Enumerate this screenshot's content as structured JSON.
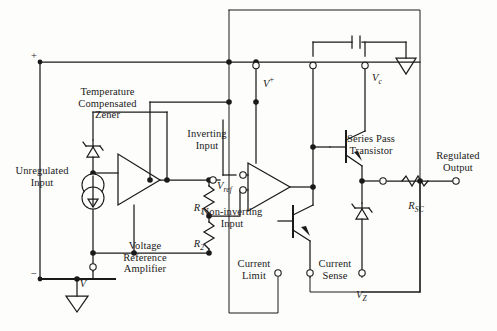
{
  "diagram": {
    "stroke_color": "#1a1a1a",
    "background_color": "#fdfdfb"
  },
  "labels": {
    "unregulated_input": "Unregulated\nInput",
    "temperature_compensated_zener": "Temperature\nCompensated\nZener",
    "voltage_reference_amplifier": "Voltage\nReference\nAmplifier",
    "inverting_input": "Inverting\nInput",
    "non_inverting_input": "Non-inverting\nInput",
    "series_pass_transistor": "Series Pass\nTransistor",
    "regulated_output": "Regulated\nOutput",
    "current_limit": "Current\nLimit",
    "current_sense": "Current\nSense",
    "r1": "R",
    "r1_sub": "1",
    "r2": "R",
    "r2_sub": "2",
    "rsc": "R",
    "rsc_sub": "SC",
    "vref": "V",
    "vref_sub": "ref",
    "vplus": "V",
    "vplus_sup": "+",
    "vminus": "V",
    "vminus_sup": "−",
    "vc": "V",
    "vc_sub": "c",
    "vz": "V",
    "vz_sub": "Z",
    "plus_sign": "+",
    "minus_sign": "−"
  },
  "terminals": [
    {
      "name": "v-plus-terminal",
      "label": "V+"
    },
    {
      "name": "vc-terminal",
      "label": "Vc"
    },
    {
      "name": "v-minus-terminal",
      "label": "V-"
    },
    {
      "name": "vref-terminal",
      "label": "Vref"
    },
    {
      "name": "current-limit-terminal",
      "label": "Current Limit"
    },
    {
      "name": "current-sense-terminal",
      "label": "Current Sense"
    },
    {
      "name": "vz-terminal",
      "label": "Vz"
    },
    {
      "name": "regulated-output-terminal",
      "label": "Regulated Output"
    },
    {
      "name": "compensation-terminal",
      "label": ""
    },
    {
      "name": "non-inverting-input-terminal",
      "label": "Non-inverting Input"
    },
    {
      "name": "inverting-input-terminal",
      "label": "Inverting Input"
    }
  ],
  "components": [
    {
      "name": "zener-diode-reference",
      "type": "zener"
    },
    {
      "name": "current-source",
      "type": "current-source"
    },
    {
      "name": "voltage-reference-amplifier",
      "type": "op-amp"
    },
    {
      "name": "error-amplifier",
      "type": "op-amp"
    },
    {
      "name": "resistor-r1",
      "type": "resistor"
    },
    {
      "name": "resistor-r2",
      "type": "resistor"
    },
    {
      "name": "resistor-rsc",
      "type": "resistor"
    },
    {
      "name": "series-pass-transistor",
      "type": "npn-transistor"
    },
    {
      "name": "current-limit-transistor",
      "type": "npn-transistor"
    },
    {
      "name": "zener-diode-vz",
      "type": "zener"
    },
    {
      "name": "compensation-capacitor",
      "type": "capacitor"
    },
    {
      "name": "ground-bottom-left",
      "type": "ground"
    },
    {
      "name": "ground-top-right",
      "type": "ground"
    }
  ]
}
